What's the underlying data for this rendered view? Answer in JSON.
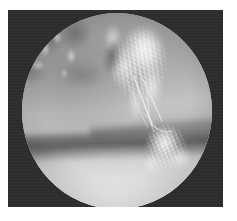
{
  "page": {
    "background_color": "#ffffff",
    "width": 237,
    "height": 221,
    "caption": ""
  },
  "photo": {
    "name": "endoscopic-photograph",
    "modality": "endoscopy",
    "color_mode": "grayscale",
    "frame_color": "#2c2c2c",
    "frame_rect": {
      "x": 8,
      "y": 10,
      "width": 215,
      "height": 197
    },
    "field_of_view": {
      "shape": "circle",
      "center_x": 109,
      "center_y": 101,
      "radius_x": 95,
      "radius_y": 98,
      "clipped_bottom": true
    }
  },
  "scene": {
    "background_tone": "#b8b8b6",
    "highlight_color": "#ffffff",
    "shadow_color": "#3c3c3a",
    "regions": [
      {
        "name": "tissue-upper-left",
        "label": "Mottled darker mucosal tissue",
        "tone": "#6e6e6c"
      },
      {
        "name": "mass-central",
        "label": "Large bright villous tissue mass",
        "tone": "#fdfdfb"
      },
      {
        "name": "mass-lower-right",
        "label": "Lower-right bright frond lesion",
        "tone": "#fafaf8"
      },
      {
        "name": "shadow-band",
        "label": "Dark horizontal shadow band",
        "tone": "#3a3a38"
      },
      {
        "name": "floor-glow",
        "label": "Illuminated lower mucosal floor",
        "tone": "#ededeb"
      },
      {
        "name": "strands",
        "label": "Thin filament strands bridging the masses",
        "tone": "#f2f2f0"
      }
    ]
  }
}
